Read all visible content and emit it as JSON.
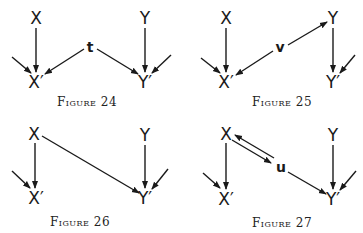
{
  "figures": [
    {
      "caption": "Figure 24",
      "nodes": {
        "x": "X",
        "xp": "X′",
        "y": "Y",
        "yp": "Y′",
        "mid": "t"
      },
      "edges": [
        "X→X′",
        "Y→Y′",
        "t→X′",
        "t→Y′",
        "external→X′",
        "external→Y′"
      ]
    },
    {
      "caption": "Figure 25",
      "nodes": {
        "x": "X",
        "xp": "X′",
        "y": "Y",
        "yp": "Y′",
        "mid": "v"
      },
      "edges": [
        "X→X′",
        "Y→Y′",
        "v→X′",
        "v→Y",
        "external→X′",
        "external→Y′"
      ]
    },
    {
      "caption": "Figure 26",
      "nodes": {
        "x": "X",
        "xp": "X′",
        "y": "Y",
        "yp": "Y′"
      },
      "edges": [
        "X→X′",
        "Y→Y′",
        "X→Y′",
        "external→X′",
        "external→Y′"
      ]
    },
    {
      "caption": "Figure 27",
      "nodes": {
        "x": "X",
        "xp": "X′",
        "y": "Y",
        "yp": "Y′",
        "mid": "u"
      },
      "edges": [
        "X→X′",
        "Y→Y′",
        "X→u",
        "u→X",
        "u→Y′",
        "external→X′",
        "external→Y′"
      ]
    }
  ]
}
